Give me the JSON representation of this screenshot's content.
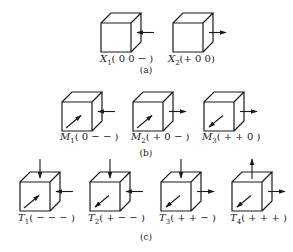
{
  "figure": {
    "ink_color": "#1a1a1a",
    "background": "#ffffff",
    "groups": [
      {
        "id": "a",
        "caption": "(a)",
        "caption_pos": [
          146,
          73
        ],
        "cubes": [
          {
            "name": "X",
            "sub": "1",
            "signs": "( 0 0 − )",
            "x": 101,
            "y": 23,
            "label_pos": [
              100,
              62
            ],
            "arrows": [
              {
                "type": "right-in"
              }
            ]
          },
          {
            "name": "X",
            "sub": "2",
            "signs": "(+ 0 0)",
            "x": 173,
            "y": 23,
            "label_pos": [
              168,
              62
            ],
            "arrows": [
              {
                "type": "right-out"
              }
            ]
          }
        ]
      },
      {
        "id": "b",
        "caption": "(b)",
        "caption_pos": [
          146,
          156
        ],
        "cubes": [
          {
            "name": "M",
            "sub": "1",
            "signs": "( 0 − − )",
            "x": 62,
            "y": 102,
            "label_pos": [
              60,
              140
            ],
            "arrows": [
              {
                "type": "right-in"
              },
              {
                "type": "front-in"
              }
            ]
          },
          {
            "name": "M",
            "sub": "2",
            "signs": "( + 0 − )",
            "x": 133,
            "y": 102,
            "label_pos": [
              131,
              140
            ],
            "arrows": [
              {
                "type": "right-out"
              },
              {
                "type": "front-in"
              }
            ]
          },
          {
            "name": "M",
            "sub": "3",
            "signs": "( + + 0 )",
            "x": 204,
            "y": 102,
            "label_pos": [
              202,
              140
            ],
            "arrows": [
              {
                "type": "right-out"
              },
              {
                "type": "front-out"
              }
            ]
          }
        ]
      },
      {
        "id": "c",
        "caption": "(c)",
        "caption_pos": [
          146,
          240
        ],
        "cubes": [
          {
            "name": "T",
            "sub": "1",
            "signs": "( − − − )",
            "x": 20,
            "y": 182,
            "label_pos": [
              18,
              221
            ],
            "arrows": [
              {
                "type": "top-in"
              },
              {
                "type": "right-in"
              },
              {
                "type": "front-in"
              }
            ]
          },
          {
            "name": "T",
            "sub": "2",
            "signs": "( + − − )",
            "x": 90,
            "y": 182,
            "label_pos": [
              88,
              221
            ],
            "arrows": [
              {
                "type": "top-in"
              },
              {
                "type": "right-in"
              },
              {
                "type": "front-out"
              }
            ]
          },
          {
            "name": "T",
            "sub": "3",
            "signs": "( + + − )",
            "x": 161,
            "y": 182,
            "label_pos": [
              159,
              221
            ],
            "arrows": [
              {
                "type": "top-in"
              },
              {
                "type": "right-out"
              },
              {
                "type": "front-out"
              }
            ]
          },
          {
            "name": "T",
            "sub": "4",
            "signs": "( + + + )",
            "x": 232,
            "y": 182,
            "label_pos": [
              230,
              221
            ],
            "arrows": [
              {
                "type": "top-out"
              },
              {
                "type": "right-out"
              },
              {
                "type": "front-out"
              }
            ]
          }
        ]
      }
    ],
    "cube_geometry": {
      "w": 30,
      "h": 29,
      "dx": 10,
      "dy": 10
    }
  }
}
